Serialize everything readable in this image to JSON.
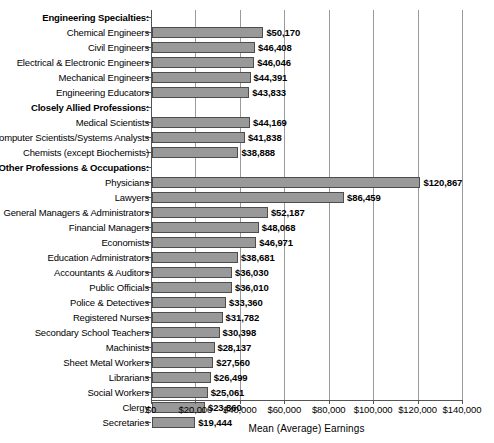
{
  "chart_data": {
    "type": "bar",
    "orientation": "horizontal",
    "title": "",
    "xlabel": "Mean (Average) Earnings",
    "ylabel": "",
    "xlim": [
      0,
      140000
    ],
    "xticks": [
      0,
      20000,
      40000,
      60000,
      80000,
      100000,
      120000,
      140000
    ],
    "xtick_labels": [
      "$0",
      "$20,000",
      "$40,000",
      "$60,000",
      "$80,000",
      "$100,000",
      "$120,000",
      "$140,000"
    ],
    "grid": true,
    "legend": null,
    "bar_color": "#999999",
    "bar_edge_color": "#4d4d4d",
    "sections": [
      {
        "header": "Engineering Specialties:",
        "items": [
          {
            "category": "Chemical Engineers",
            "value": 50170,
            "label": "$50,170"
          },
          {
            "category": "Civil Engineers",
            "value": 46408,
            "label": "$46,408"
          },
          {
            "category": "Electrical & Electronic Engineers",
            "value": 46046,
            "label": "$46,046"
          },
          {
            "category": "Mechanical Engineers",
            "value": 44391,
            "label": "$44,391"
          },
          {
            "category": "Engineering Educators",
            "value": 43833,
            "label": "$43,833"
          }
        ]
      },
      {
        "header": "Closely Allied Professions:",
        "items": [
          {
            "category": "Medical Scientists",
            "value": 44169,
            "label": "$44,169"
          },
          {
            "category": "Computer Scientists/Systems Analysts",
            "value": 41838,
            "label": "$41,838"
          },
          {
            "category": "Chemists (except Biochemists)",
            "value": 38888,
            "label": "$38,888"
          }
        ]
      },
      {
        "header": "Other Professions & Occupations:",
        "items": [
          {
            "category": "Physicians",
            "value": 120867,
            "label": "$120,867"
          },
          {
            "category": "Lawyers",
            "value": 86459,
            "label": "$86,459"
          },
          {
            "category": "General Managers & Administrators",
            "value": 52187,
            "label": "$52,187"
          },
          {
            "category": "Financial Managers",
            "value": 48068,
            "label": "$48,068"
          },
          {
            "category": "Economists",
            "value": 46971,
            "label": "$46,971"
          },
          {
            "category": "Education Administrators",
            "value": 38681,
            "label": "$38,681"
          },
          {
            "category": "Accountants & Auditors",
            "value": 36030,
            "label": "$36,030"
          },
          {
            "category": "Public Officials",
            "value": 36010,
            "label": "$36,010"
          },
          {
            "category": "Police & Detectives",
            "value": 33360,
            "label": "$33,360"
          },
          {
            "category": "Registered Nurses",
            "value": 31782,
            "label": "$31,782"
          },
          {
            "category": "Secondary School Teachers",
            "value": 30398,
            "label": "$30,398"
          },
          {
            "category": "Machinists",
            "value": 28137,
            "label": "$28,137"
          },
          {
            "category": "Sheet Metal Workers",
            "value": 27560,
            "label": "$27,560"
          },
          {
            "category": "Librarians",
            "value": 26499,
            "label": "$26,499"
          },
          {
            "category": "Social Workers",
            "value": 25061,
            "label": "$25,061"
          },
          {
            "category": "Clergy",
            "value": 23860,
            "label": "$23,860"
          },
          {
            "category": "Secretaries",
            "value": 19444,
            "label": "$19,444"
          }
        ]
      }
    ]
  }
}
